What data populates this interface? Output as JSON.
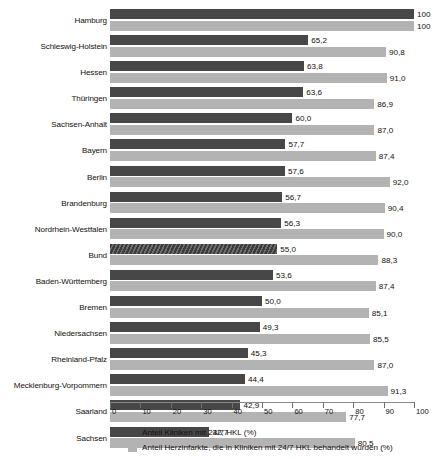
{
  "chart_data": {
    "type": "bar",
    "orientation": "horizontal",
    "title": "",
    "subtitle": "",
    "xlabel": "",
    "ylabel": "",
    "xlim": [
      0,
      100
    ],
    "xticks": [
      0,
      10,
      20,
      30,
      40,
      50,
      60,
      70,
      80,
      90,
      100
    ],
    "grid": false,
    "legend_position": "bottom",
    "decimal_separator": ",",
    "highlighted_category": "Bund",
    "highlight_style": "diagonal-hatch",
    "colors": {
      "series_1": "#474747",
      "series_2": "#b3b3b3",
      "axis": "#8a8a8a",
      "text": "#15100c",
      "background": "#ffffff"
    },
    "categories": [
      "Hamburg",
      "Schleswig-Holstein",
      "Hessen",
      "Thüringen",
      "Sachsen-Anhalt",
      "Bayern",
      "Berlin",
      "Brandenburg",
      "Nordrhein-Westfalen",
      "Bund",
      "Baden-Württemberg",
      "Bremen",
      "Niedersachsen",
      "Rheinland-Pfalz",
      "Mecklenburg-Vorpommern",
      "Saarland",
      "Sachsen"
    ],
    "series": [
      {
        "name": "Anteil Kliniken mit 24/7 HKL (%)",
        "color": "#474747",
        "values": [
          100,
          65.2,
          63.8,
          63.6,
          60.0,
          57.7,
          57.6,
          56.7,
          56.3,
          55.0,
          53.6,
          50.0,
          49.3,
          45.3,
          44.4,
          42.9,
          32.7
        ],
        "labels": [
          "100",
          "65,2",
          "63,8",
          "63,6",
          "60,0",
          "57,7",
          "57,6",
          "56,7",
          "56,3",
          "55,0",
          "53,6",
          "50,0",
          "49,3",
          "45,3",
          "44,4",
          "42,9",
          "32,7"
        ]
      },
      {
        "name": "Anteil Herzinfarkte, die in Kliniken mit 24/7 HKL behandelt wurden (%)",
        "color": "#b3b3b3",
        "values": [
          100,
          90.8,
          91.0,
          86.9,
          87.0,
          87.4,
          92.0,
          90.4,
          90.0,
          88.3,
          87.4,
          85.1,
          85.5,
          87.0,
          91.3,
          77.7,
          80.5
        ],
        "labels": [
          "100",
          "90,8",
          "91,0",
          "86,9",
          "87,0",
          "87,4",
          "92,0",
          "90,4",
          "90,0",
          "88,3",
          "87,4",
          "85,1",
          "85,5",
          "87,0",
          "91,3",
          "77,7",
          "80,5"
        ]
      }
    ],
    "tick_labels": [
      "0",
      "10",
      "20",
      "30",
      "40",
      "50",
      "60",
      "70",
      "80",
      "90",
      "100"
    ],
    "legend": [
      {
        "label": "Anteil Kliniken mit 24/7 HKL (%)",
        "swatch": "dark"
      },
      {
        "label": "Anteil Herzinfarkte, die in Kliniken mit 24/7 HKL behandelt wurden (%)",
        "swatch": "light"
      }
    ]
  }
}
